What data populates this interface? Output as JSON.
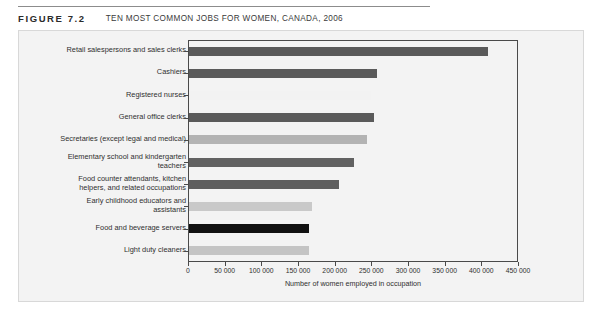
{
  "header": {
    "figure_number": "FIGURE 7.2",
    "figure_title": "TEN MOST COMMON JOBS FOR WOMEN, CANADA, 2006"
  },
  "chart_data": {
    "type": "bar",
    "orientation": "horizontal",
    "title": "TEN MOST COMMON JOBS FOR WOMEN, CANADA, 2006",
    "xlabel": "Number of women employed in occupation",
    "ylabel": "",
    "xlim": [
      0,
      450000
    ],
    "grid": false,
    "legend": false,
    "tick_labels": [
      "0",
      "50 000",
      "100 000",
      "150 000",
      "200 000",
      "250 000",
      "300 000",
      "350 000",
      "400 000",
      "450 000"
    ],
    "tick_values": [
      0,
      50000,
      100000,
      150000,
      200000,
      250000,
      300000,
      350000,
      400000,
      450000
    ],
    "categories": [
      "Retail salespersons and sales clerks",
      "Cashiers",
      "Registered nurses",
      "General office clerks",
      "Secretaries (except legal and medical)",
      "Elementary school and kindergarten\nteachers",
      "Food counter attendants, kitchen\nhelpers, and related occupations",
      "Early childhood educators and\nassistants",
      "Food and beverage servers",
      "Light duty cleaners"
    ],
    "values": [
      408000,
      256000,
      248000,
      252000,
      243000,
      225000,
      205000,
      168000,
      164000,
      164000
    ],
    "bar_colors": [
      "#5a5a5a",
      "#5a5a5a",
      "#f2f2f2",
      "#5a5a5a",
      "#b3b3b3",
      "#616161",
      "#5e5e5e",
      "#c9c9c9",
      "#111111",
      "#c4c4c4"
    ]
  }
}
